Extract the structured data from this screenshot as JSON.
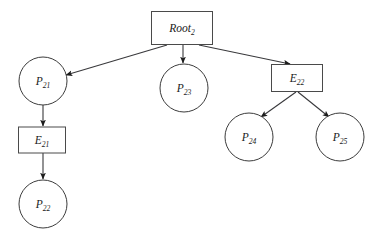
{
  "diagram": {
    "type": "directed-tree",
    "title": "",
    "background_color": "#ffffff",
    "stroke_color": "#39393c",
    "label_color": "#1a1a1a",
    "nodes": [
      {
        "id": "root2",
        "shape": "rect",
        "base": "Root",
        "subscript": "2",
        "x": 182,
        "y": 28,
        "w": 61,
        "h": 33
      },
      {
        "id": "p21",
        "shape": "circle",
        "base": "P",
        "subscript": "21",
        "x": 43,
        "y": 81,
        "r": 24
      },
      {
        "id": "e21",
        "shape": "rect",
        "base": "E",
        "subscript": "21",
        "x": 42,
        "y": 140,
        "w": 47,
        "h": 26
      },
      {
        "id": "p22",
        "shape": "circle",
        "base": "P",
        "subscript": "22",
        "x": 43,
        "y": 204,
        "r": 24
      },
      {
        "id": "p23",
        "shape": "circle",
        "base": "P",
        "subscript": "23",
        "x": 184,
        "y": 88,
        "r": 24
      },
      {
        "id": "e22",
        "shape": "rect",
        "base": "E",
        "subscript": "22",
        "x": 297,
        "y": 78,
        "w": 51,
        "h": 27
      },
      {
        "id": "p24",
        "shape": "circle",
        "base": "P",
        "subscript": "24",
        "x": 249,
        "y": 137,
        "r": 24
      },
      {
        "id": "p25",
        "shape": "circle",
        "base": "P",
        "subscript": "25",
        "x": 340,
        "y": 137,
        "r": 24
      }
    ],
    "edges": [
      {
        "id": "root2-p21",
        "from": "root2",
        "to": "p21",
        "x1": 167,
        "y1": 45,
        "x2": 66,
        "y2": 75,
        "arrow": true
      },
      {
        "id": "root2-p23",
        "from": "root2",
        "to": "p23",
        "x1": 183,
        "y1": 45,
        "x2": 183,
        "y2": 63,
        "arrow": true
      },
      {
        "id": "root2-e22",
        "from": "root2",
        "to": "e22",
        "x1": 199,
        "y1": 45,
        "x2": 290,
        "y2": 64,
        "arrow": true
      },
      {
        "id": "p21-e21",
        "from": "p21",
        "to": "e21",
        "x1": 43,
        "y1": 105,
        "x2": 43,
        "y2": 126,
        "arrow": true
      },
      {
        "id": "e21-p22",
        "from": "e21",
        "to": "p22",
        "x1": 43,
        "y1": 153,
        "x2": 43,
        "y2": 179,
        "arrow": true
      },
      {
        "id": "e22-p24",
        "from": "e22",
        "to": "p24",
        "x1": 296,
        "y1": 92,
        "x2": 261,
        "y2": 117,
        "arrow": true
      },
      {
        "id": "e22-p25",
        "from": "e22",
        "to": "p25",
        "x1": 298,
        "y1": 92,
        "x2": 329,
        "y2": 117,
        "arrow": true
      }
    ]
  }
}
